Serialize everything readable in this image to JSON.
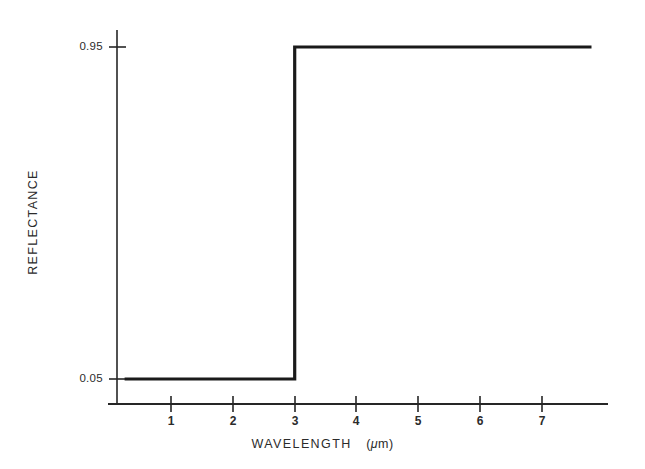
{
  "chart_data": {
    "type": "line",
    "title": "",
    "subtitle": "",
    "xlabel": "WAVELENGTH",
    "xunit": "(μm)",
    "ylabel": "REFLECTANCE",
    "xlim": [
      0.2,
      8.0
    ],
    "ylim": [
      0.0,
      1.02
    ],
    "grid": false,
    "legend": null,
    "xticks": [
      1,
      2,
      3,
      4,
      5,
      6,
      7
    ],
    "xticklabels": [
      "1",
      "2",
      "3",
      "4",
      "5",
      "6",
      "7"
    ],
    "yticks": [
      0.05,
      0.95
    ],
    "yticklabels": [
      "0.05",
      "0.95"
    ],
    "step_cutoff": 3,
    "series": [
      {
        "name": "ideal spectrally selective reflectance",
        "style": "step",
        "color": "#1a1a1a",
        "linewidth": 3,
        "x": [
          0.25,
          3.0,
          3.0,
          7.8
        ],
        "y": [
          0.05,
          0.05,
          0.95,
          0.95
        ],
        "points": [
          {
            "x": 0.25,
            "y": 0.05
          },
          {
            "x": 3.0,
            "y": 0.05
          },
          {
            "x": 3.0,
            "y": 0.95
          },
          {
            "x": 7.8,
            "y": 0.95
          }
        ]
      }
    ],
    "annotations": []
  },
  "axis_titles": {
    "x_main": "WAVELENGTH",
    "x_unit_open": "(",
    "x_unit_mu": "μ",
    "x_unit_rest": "m)",
    "y": "REFLECTANCE"
  },
  "ticklabels": {
    "y": [
      {
        "value": "0.95"
      },
      {
        "value": "0.05"
      }
    ],
    "x": [
      {
        "value": "1"
      },
      {
        "value": "2"
      },
      {
        "value": "3"
      },
      {
        "value": "4"
      },
      {
        "value": "5"
      },
      {
        "value": "6"
      },
      {
        "value": "7"
      }
    ]
  },
  "colors": {
    "background": "#ffffff",
    "ink": "#1a1a1a",
    "axis": "#262626",
    "text": "#2b2b2b"
  }
}
